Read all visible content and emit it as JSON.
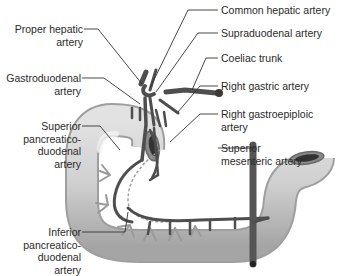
{
  "diagram": {
    "labels_right": [
      {
        "id": "common-hepatic",
        "text": "Common hepatic artery"
      },
      {
        "id": "supraduodenal",
        "text": "Supraduodenal artery"
      },
      {
        "id": "coeliac",
        "text": "Coeliac trunk"
      },
      {
        "id": "right-gastric",
        "text": "Right gastric artery"
      },
      {
        "id": "right-gastroepiploic",
        "lines": [
          "Right gastroepiploic",
          "artery"
        ]
      },
      {
        "id": "superior-mesenteric",
        "lines": [
          "Superior",
          "mesenteric artery"
        ]
      }
    ],
    "labels_left": [
      {
        "id": "proper-hepatic",
        "lines": [
          "Proper hepatic",
          "artery"
        ]
      },
      {
        "id": "gastroduodenal",
        "lines": [
          "Gastroduodenal",
          "artery"
        ]
      },
      {
        "id": "superior-pd",
        "lines": [
          "Superior",
          "pancreatico-",
          "duodenal",
          "artery"
        ]
      },
      {
        "id": "inferior-pd",
        "lines": [
          "Inferior",
          "pancreatico-",
          "duodenal",
          "artery"
        ]
      }
    ],
    "colors": {
      "artery": "#555555",
      "artery_dark": "#3a3a3a",
      "duodenum_light": "#e6e6e6",
      "duodenum_shade": "#a8a8a8",
      "pancreas_branches": "#9a9a9a",
      "leader_line": "#333333"
    }
  }
}
